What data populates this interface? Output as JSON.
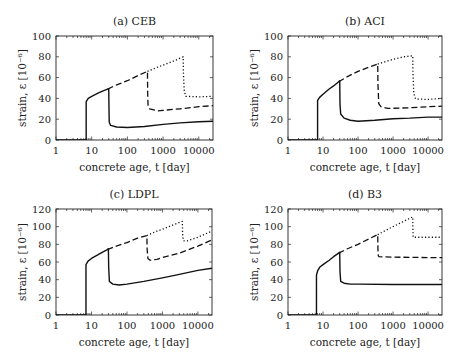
{
  "figure": {
    "panels_layout": "2x2"
  },
  "chart_data": [
    {
      "id": "a",
      "type": "line",
      "title": "(a) CEB",
      "xlabel": "concrete age, t [day]",
      "ylabel": "strain, ε [10⁻⁶]",
      "xscale": "log",
      "xlim": [
        1,
        25000
      ],
      "ylim": [
        0,
        100
      ],
      "xticks": [
        1,
        10,
        100,
        1000,
        10000
      ],
      "xtick_labels": [
        "1",
        "10",
        "100",
        "1000",
        "10000"
      ],
      "yticks": [
        0,
        20,
        40,
        60,
        80,
        100
      ],
      "frame": {
        "left": 56,
        "top": 36,
        "right": 213,
        "bottom": 140
      },
      "series": [
        {
          "name": "unloaded at 28 days",
          "style": "solid",
          "points": [
            [
              1,
              0
            ],
            [
              7,
              0
            ],
            [
              7,
              37
            ],
            [
              8,
              40
            ],
            [
              10,
              42
            ],
            [
              15,
              45
            ],
            [
              20,
              47
            ],
            [
              28,
              49
            ],
            [
              30,
              49
            ],
            [
              30.5,
              30
            ],
            [
              31,
              17
            ],
            [
              34,
              14
            ],
            [
              50,
              12.5
            ],
            [
              100,
              12
            ],
            [
              300,
              13
            ],
            [
              1000,
              15
            ],
            [
              3000,
              16.5
            ],
            [
              10000,
              17.5
            ],
            [
              25000,
              18
            ]
          ]
        },
        {
          "name": "unloaded at 365 days",
          "style": "dashed",
          "points": [
            [
              28,
              49
            ],
            [
              50,
              53
            ],
            [
              100,
              57
            ],
            [
              200,
              62
            ],
            [
              365,
              66
            ],
            [
              370,
              45
            ],
            [
              380,
              32
            ],
            [
              420,
              30
            ],
            [
              700,
              28
            ],
            [
              1000,
              28.5
            ],
            [
              3000,
              30
            ],
            [
              10000,
              32
            ],
            [
              25000,
              33
            ]
          ]
        },
        {
          "name": "unloaded at 3650 days",
          "style": "dotted",
          "points": [
            [
              365,
              66
            ],
            [
              700,
              70
            ],
            [
              1000,
              72
            ],
            [
              2000,
              76
            ],
            [
              3650,
              80
            ],
            [
              3700,
              65
            ],
            [
              3900,
              48
            ],
            [
              4300,
              42
            ],
            [
              10000,
              41.5
            ],
            [
              25000,
              42
            ]
          ]
        }
      ]
    },
    {
      "id": "b",
      "type": "line",
      "title": "(b) ACI",
      "xlabel": "concrete age, t [day]",
      "ylabel": "strain, ε [10⁻⁶]",
      "xscale": "log",
      "xlim": [
        1,
        25000
      ],
      "ylim": [
        0,
        100
      ],
      "xticks": [
        1,
        10,
        100,
        1000,
        10000
      ],
      "xtick_labels": [
        "1",
        "10",
        "100",
        "1000",
        "10000"
      ],
      "yticks": [
        0,
        20,
        40,
        60,
        80,
        100
      ],
      "frame": {
        "left": 288,
        "top": 36,
        "right": 442,
        "bottom": 140
      },
      "series": [
        {
          "name": "unloaded at 28 days",
          "style": "solid",
          "points": [
            [
              1,
              0
            ],
            [
              7,
              0
            ],
            [
              7,
              38
            ],
            [
              8,
              41
            ],
            [
              10,
              44
            ],
            [
              15,
              49
            ],
            [
              20,
              52
            ],
            [
              28,
              56
            ],
            [
              30,
              57
            ],
            [
              30.5,
              35
            ],
            [
              32,
              25
            ],
            [
              40,
              21
            ],
            [
              60,
              19
            ],
            [
              100,
              18
            ],
            [
              300,
              19
            ],
            [
              1000,
              20.5
            ],
            [
              3000,
              21
            ],
            [
              10000,
              22
            ],
            [
              25000,
              22
            ]
          ]
        },
        {
          "name": "unloaded at 365 days",
          "style": "dashed",
          "points": [
            [
              28,
              56
            ],
            [
              50,
              61
            ],
            [
              100,
              66
            ],
            [
              200,
              70
            ],
            [
              365,
              73
            ],
            [
              370,
              55
            ],
            [
              390,
              35
            ],
            [
              450,
              32
            ],
            [
              700,
              30.5
            ],
            [
              1000,
              30.5
            ],
            [
              3000,
              31
            ],
            [
              10000,
              32
            ],
            [
              25000,
              32.5
            ]
          ]
        },
        {
          "name": "unloaded at 3650 days",
          "style": "dotted",
          "points": [
            [
              365,
              73
            ],
            [
              700,
              76
            ],
            [
              1000,
              77.5
            ],
            [
              2000,
              80
            ],
            [
              3650,
              81
            ],
            [
              3700,
              65
            ],
            [
              3900,
              45
            ],
            [
              4400,
              39.5
            ],
            [
              10000,
              39
            ],
            [
              25000,
              40
            ]
          ]
        }
      ]
    },
    {
      "id": "c",
      "type": "line",
      "title": "(c) LDPL",
      "xlabel": "concrete age, t [day]",
      "ylabel": "strain, ε [10⁻⁶]",
      "xscale": "log",
      "xlim": [
        1,
        25000
      ],
      "ylim": [
        0,
        120
      ],
      "xticks": [
        1,
        10,
        100,
        1000,
        10000
      ],
      "xtick_labels": [
        "1",
        "10",
        "100",
        "1000",
        "10000"
      ],
      "yticks": [
        0,
        20,
        40,
        60,
        80,
        100,
        120
      ],
      "frame": {
        "left": 56,
        "top": 209,
        "right": 212,
        "bottom": 315
      },
      "series": [
        {
          "name": "unloaded at 28 days",
          "style": "solid",
          "points": [
            [
              1,
              0
            ],
            [
              7,
              0
            ],
            [
              7,
              57
            ],
            [
              8,
              61
            ],
            [
              10,
              64
            ],
            [
              15,
              68
            ],
            [
              20,
              71
            ],
            [
              28,
              74
            ],
            [
              30,
              75
            ],
            [
              30.5,
              55
            ],
            [
              32,
              38
            ],
            [
              40,
              35
            ],
            [
              60,
              34
            ],
            [
              100,
              35
            ],
            [
              300,
              38
            ],
            [
              1000,
              42
            ],
            [
              3000,
              46
            ],
            [
              10000,
              50.5
            ],
            [
              25000,
              53
            ]
          ]
        },
        {
          "name": "unloaded at 365 days",
          "style": "dashed",
          "points": [
            [
              28,
              74
            ],
            [
              50,
              78
            ],
            [
              100,
              82
            ],
            [
              200,
              87
            ],
            [
              365,
              90
            ],
            [
              370,
              75
            ],
            [
              390,
              64
            ],
            [
              450,
              62
            ],
            [
              700,
              63
            ],
            [
              1000,
              65
            ],
            [
              3000,
              70
            ],
            [
              10000,
              78
            ],
            [
              25000,
              85
            ]
          ]
        },
        {
          "name": "unloaded at 3650 days",
          "style": "dotted",
          "points": [
            [
              365,
              90
            ],
            [
              700,
              95
            ],
            [
              1000,
              97
            ],
            [
              2000,
              102
            ],
            [
              3650,
              106
            ],
            [
              3700,
              92
            ],
            [
              3900,
              84
            ],
            [
              5000,
              84
            ],
            [
              10000,
              88
            ],
            [
              25000,
              95
            ]
          ]
        }
      ]
    },
    {
      "id": "d",
      "type": "line",
      "title": "(d) B3",
      "xlabel": "concrete age, t [day]",
      "ylabel": "strain, ε [10⁻⁶]",
      "xscale": "log",
      "xlim": [
        1,
        25000
      ],
      "ylim": [
        0,
        120
      ],
      "xticks": [
        1,
        10,
        100,
        1000,
        10000
      ],
      "xtick_labels": [
        "1",
        "10",
        "100",
        "1000",
        "10000"
      ],
      "yticks": [
        0,
        20,
        40,
        60,
        80,
        100,
        120
      ],
      "frame": {
        "left": 288,
        "top": 209,
        "right": 442,
        "bottom": 315
      },
      "series": [
        {
          "name": "unloaded at 28 days",
          "style": "solid",
          "points": [
            [
              1,
              0
            ],
            [
              6.5,
              0
            ],
            [
              6.5,
              45
            ],
            [
              7,
              50
            ],
            [
              8,
              54
            ],
            [
              10,
              57
            ],
            [
              15,
              62
            ],
            [
              20,
              66
            ],
            [
              28,
              70
            ],
            [
              30,
              71
            ],
            [
              30.5,
              50
            ],
            [
              32,
              38
            ],
            [
              40,
              36
            ],
            [
              60,
              35
            ],
            [
              100,
              35
            ],
            [
              1000,
              34.5
            ],
            [
              10000,
              34.5
            ],
            [
              25000,
              34.5
            ]
          ]
        },
        {
          "name": "unloaded at 365 days",
          "style": "dashed",
          "points": [
            [
              28,
              70
            ],
            [
              50,
              75
            ],
            [
              100,
              80
            ],
            [
              200,
              86
            ],
            [
              365,
              91
            ],
            [
              370,
              75
            ],
            [
              380,
              67
            ],
            [
              400,
              66
            ],
            [
              1000,
              65.5
            ],
            [
              10000,
              65
            ],
            [
              25000,
              65
            ]
          ]
        },
        {
          "name": "unloaded at 3650 days",
          "style": "dotted",
          "points": [
            [
              365,
              91
            ],
            [
              700,
              97
            ],
            [
              1000,
              100
            ],
            [
              2000,
              106
            ],
            [
              3650,
              111
            ],
            [
              3700,
              95
            ],
            [
              3750,
              88
            ],
            [
              5000,
              88
            ],
            [
              10000,
              88
            ],
            [
              25000,
              88
            ]
          ]
        }
      ]
    }
  ]
}
